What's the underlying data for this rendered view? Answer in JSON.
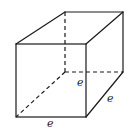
{
  "figure": {
    "type": "cube",
    "labels": {
      "height": "e",
      "depth": "e",
      "width": "e"
    },
    "vertices": {
      "front_top_left": [
        16,
        44
      ],
      "front_top_right": [
        86,
        44
      ],
      "front_bottom_left": [
        16,
        117
      ],
      "front_bottom_right": [
        86,
        117
      ],
      "back_top_left": [
        65,
        12
      ],
      "back_top_right": [
        123,
        12
      ],
      "back_bottom_left": [
        65,
        72
      ],
      "back_bottom_right": [
        123,
        72
      ]
    },
    "colors": {
      "line": "#1a1a1a",
      "background": "#ffffff"
    }
  }
}
